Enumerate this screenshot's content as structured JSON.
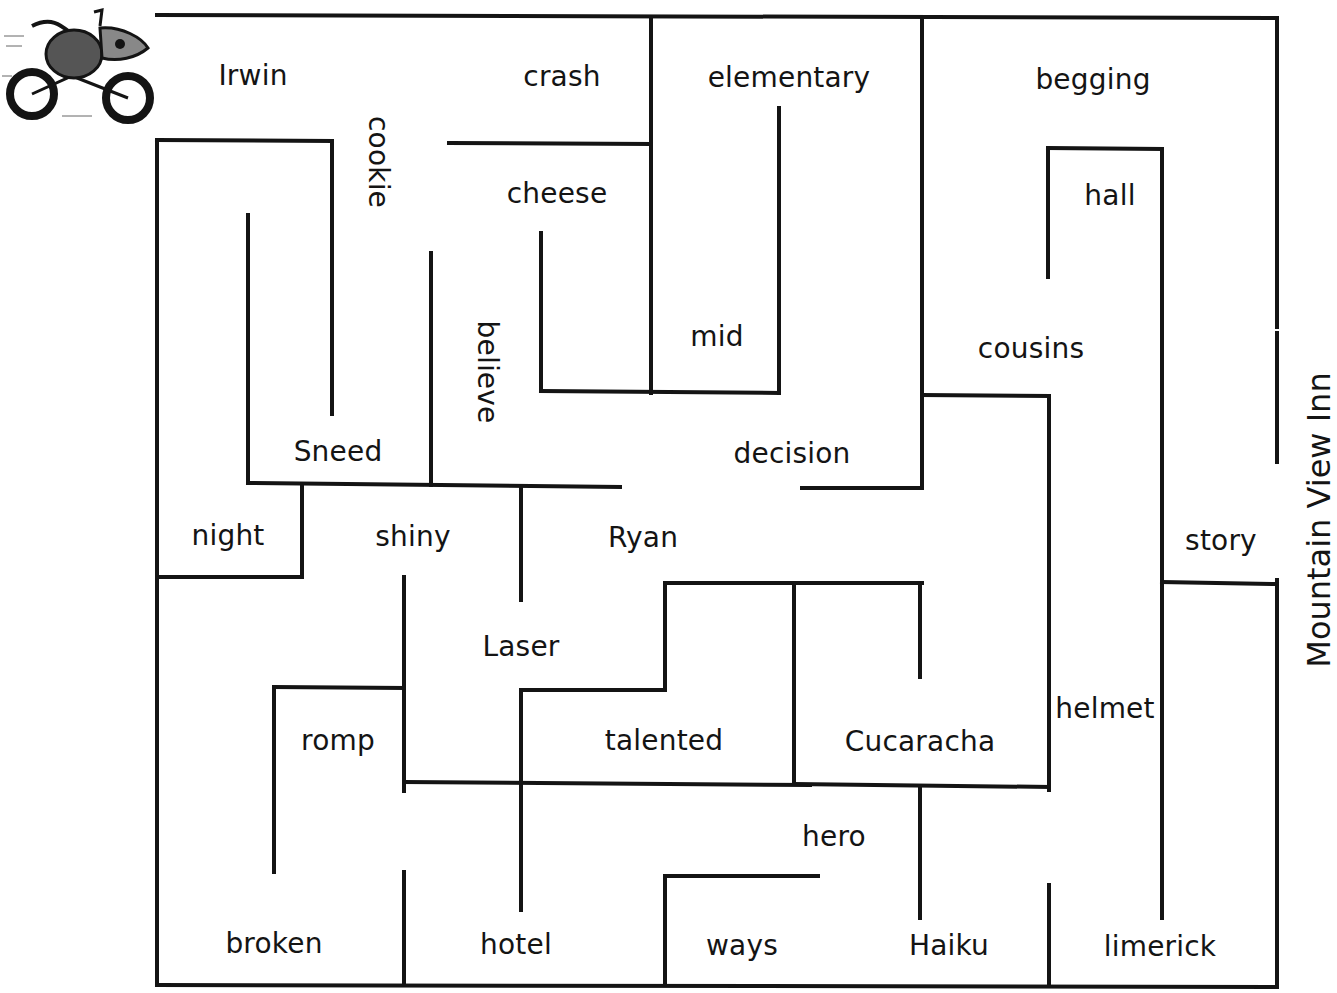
{
  "title": "Mountain View Inn",
  "mascot": {
    "icon": "fish-riding-motorcycle-illustration"
  },
  "colors": {
    "ink": "#141414",
    "background": "#ffffff"
  },
  "words": [
    {
      "text": "Irwin",
      "x": 253,
      "y": 76,
      "vertical": false
    },
    {
      "text": "crash",
      "x": 562,
      "y": 77,
      "vertical": false
    },
    {
      "text": "elementary",
      "x": 789,
      "y": 78,
      "vertical": false
    },
    {
      "text": "begging",
      "x": 1093,
      "y": 80,
      "vertical": false
    },
    {
      "text": "cookie",
      "x": 378,
      "y": 162,
      "vertical": true
    },
    {
      "text": "cheese",
      "x": 557,
      "y": 194,
      "vertical": false
    },
    {
      "text": "hall",
      "x": 1110,
      "y": 196,
      "vertical": false
    },
    {
      "text": "mid",
      "x": 717,
      "y": 337,
      "vertical": false
    },
    {
      "text": "believe",
      "x": 487,
      "y": 372,
      "vertical": true
    },
    {
      "text": "cousins",
      "x": 1031,
      "y": 349,
      "vertical": false
    },
    {
      "text": "Sneed",
      "x": 338,
      "y": 452,
      "vertical": false
    },
    {
      "text": "decision",
      "x": 792,
      "y": 454,
      "vertical": false
    },
    {
      "text": "night",
      "x": 228,
      "y": 536,
      "vertical": false
    },
    {
      "text": "shiny",
      "x": 413,
      "y": 537,
      "vertical": false
    },
    {
      "text": "Ryan",
      "x": 643,
      "y": 538,
      "vertical": false
    },
    {
      "text": "story",
      "x": 1221,
      "y": 541,
      "vertical": false
    },
    {
      "text": "Laser",
      "x": 521,
      "y": 647,
      "vertical": false
    },
    {
      "text": "helmet",
      "x": 1105,
      "y": 709,
      "vertical": false
    },
    {
      "text": "romp",
      "x": 338,
      "y": 741,
      "vertical": false
    },
    {
      "text": "talented",
      "x": 664,
      "y": 741,
      "vertical": false
    },
    {
      "text": "Cucaracha",
      "x": 920,
      "y": 742,
      "vertical": false
    },
    {
      "text": "hero",
      "x": 834,
      "y": 837,
      "vertical": false
    },
    {
      "text": "broken",
      "x": 274,
      "y": 944,
      "vertical": false
    },
    {
      "text": "hotel",
      "x": 516,
      "y": 945,
      "vertical": false
    },
    {
      "text": "ways",
      "x": 742,
      "y": 946,
      "vertical": false
    },
    {
      "text": "Haiku",
      "x": 949,
      "y": 946,
      "vertical": false
    },
    {
      "text": "limerick",
      "x": 1160,
      "y": 947,
      "vertical": false
    }
  ],
  "walls": [
    [
      157,
      15,
      1277,
      18
    ],
    [
      1277,
      18,
      1277,
      327
    ],
    [
      1277,
      333,
      1277,
      462
    ],
    [
      1277,
      580,
      1277,
      987
    ],
    [
      157,
      985,
      1277,
      987
    ],
    [
      157,
      140,
      157,
      985
    ],
    [
      157,
      140,
      332,
      141
    ],
    [
      332,
      141,
      332,
      414
    ],
    [
      248,
      215,
      248,
      483
    ],
    [
      248,
      483,
      620,
      487
    ],
    [
      431,
      253,
      431,
      485
    ],
    [
      302,
      485,
      302,
      577
    ],
    [
      157,
      577,
      302,
      577
    ],
    [
      521,
      487,
      521,
      600
    ],
    [
      449,
      143,
      651,
      144
    ],
    [
      651,
      18,
      651,
      393
    ],
    [
      541,
      233,
      541,
      391
    ],
    [
      541,
      391,
      779,
      393
    ],
    [
      779,
      108,
      779,
      393
    ],
    [
      922,
      18,
      922,
      488
    ],
    [
      802,
      488,
      922,
      488
    ],
    [
      922,
      395,
      1049,
      396
    ],
    [
      1049,
      396,
      1049,
      790
    ],
    [
      1048,
      148,
      1162,
      149
    ],
    [
      1048,
      148,
      1048,
      277
    ],
    [
      1162,
      149,
      1162,
      918
    ],
    [
      1162,
      582,
      1277,
      584
    ],
    [
      404,
      577,
      404,
      791
    ],
    [
      274,
      687,
      404,
      688
    ],
    [
      274,
      687,
      274,
      872
    ],
    [
      404,
      782,
      810,
      785
    ],
    [
      521,
      690,
      521,
      910
    ],
    [
      521,
      690,
      665,
      690
    ],
    [
      665,
      583,
      665,
      690
    ],
    [
      665,
      583,
      922,
      583
    ],
    [
      794,
      583,
      794,
      784
    ],
    [
      920,
      583,
      920,
      677
    ],
    [
      794,
      784,
      1049,
      787
    ],
    [
      920,
      787,
      920,
      918
    ],
    [
      404,
      872,
      404,
      985
    ],
    [
      665,
      876,
      665,
      985
    ],
    [
      665,
      876,
      818,
      876
    ],
    [
      1049,
      885,
      1049,
      985
    ]
  ]
}
